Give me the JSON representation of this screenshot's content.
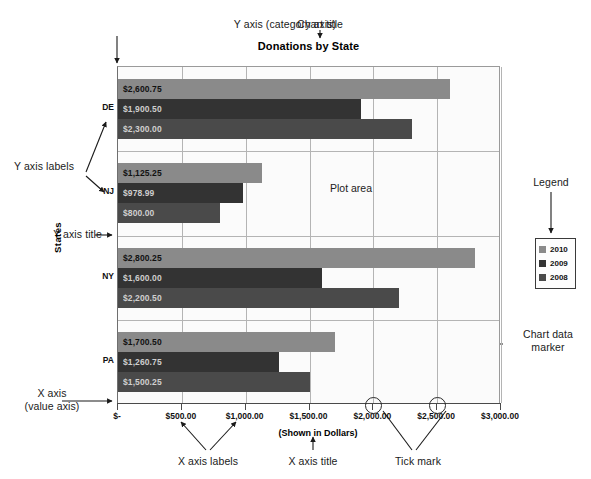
{
  "chart_data": {
    "type": "bar",
    "orientation": "horizontal",
    "title": "Donations by State",
    "xlabel": "(Shown in Dollars)",
    "ylabel": "States",
    "xlim": [
      0,
      3000
    ],
    "categories": [
      "DE",
      "NJ",
      "NY",
      "PA"
    ],
    "xticks": [
      "$-",
      "$500.00",
      "$1,000.00",
      "$1,500.00",
      "$2,000.00",
      "$2,500.00",
      "$3,000.00"
    ],
    "xtickvalues": [
      0,
      500,
      1000,
      1500,
      2000,
      2500,
      3000
    ],
    "grid": true,
    "legend_position": "right",
    "series": [
      {
        "name": "2010",
        "color": "#8a8a8a",
        "values": [
          2600.75,
          1125.25,
          2800.25,
          1700.5
        ],
        "labels": [
          "$2,600.75",
          "$1,125.25",
          "$2,800.25",
          "$1,700.50"
        ]
      },
      {
        "name": "2009",
        "color": "#333333",
        "values": [
          1900.5,
          978.99,
          1600.0,
          1260.75
        ],
        "labels": [
          "$1,900.50",
          "$978.99",
          "$1,600.00",
          "$1,260.75"
        ]
      },
      {
        "name": "2008",
        "color": "#4a4a4a",
        "values": [
          2300.0,
          800.0,
          2200.5,
          1500.25
        ],
        "labels": [
          "$2,300.00",
          "$800.00",
          "$2,200.50",
          "$1,500.25"
        ]
      }
    ]
  },
  "plot_area_label": "Plot area",
  "annotations": {
    "y_axis_category": "Y axis (category axis)",
    "chart_title_callout": "Chart title",
    "y_axis_labels": "Y axis labels",
    "y_axis_title": "Y axis title",
    "x_axis_value": "X axis\n(value axis)",
    "x_axis_labels": "X axis labels",
    "x_axis_title": "X axis title",
    "tick_mark": "Tick mark",
    "legend": "Legend",
    "chart_data_marker": "Chart data\nmarker"
  }
}
